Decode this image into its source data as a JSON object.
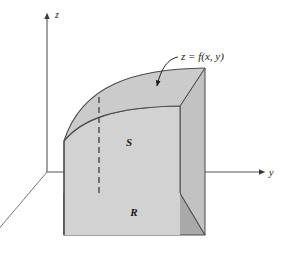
{
  "figure": {
    "type": "3d-diagram",
    "background_color": "#ffffff",
    "width": 286,
    "height": 266
  },
  "axes": {
    "z": {
      "label": "z",
      "direction": "up",
      "has_arrowhead": true
    },
    "y": {
      "label": "y",
      "direction": "right",
      "has_arrowhead": true
    },
    "x": {
      "label": "",
      "direction": "down-left",
      "has_arrowhead": false
    }
  },
  "labels": {
    "surface_equation": "z = f(x, y)",
    "solid_region": "S",
    "base_region": "R"
  },
  "colors": {
    "front_face": "#d2d2d2",
    "side_face": "#c2c2c2",
    "top_surface": "#cbcbcb",
    "base_region": "#a9a9a9",
    "outline": "#4a4a4a",
    "axis": "#555555",
    "dashed": "#555555",
    "text": "#1a1a1a"
  },
  "annotation": {
    "leader_from": "z = f(x, y)",
    "leader_to": "top-curved-surface",
    "arrowhead": true
  }
}
